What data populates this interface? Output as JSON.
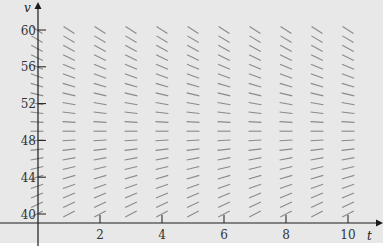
{
  "chart_data": {
    "type": "slope-field",
    "title": "",
    "equation": "dv/dt = 9.8 - v/5",
    "xlabel": "t",
    "ylabel": "v",
    "xlim": [
      0,
      10.5
    ],
    "ylim": [
      39,
      61.5
    ],
    "x_ticks": [
      2,
      4,
      6,
      8,
      10
    ],
    "y_ticks": [
      40,
      44,
      48,
      52,
      56,
      60
    ],
    "grid": false,
    "field_t_values": [
      0,
      1,
      2,
      3,
      4,
      5,
      6,
      7,
      8,
      9,
      10
    ],
    "field_v_values": [
      40,
      41,
      42,
      43,
      44,
      45,
      46,
      47,
      48,
      49,
      50,
      51,
      52,
      53,
      54,
      55,
      56,
      57,
      58,
      59,
      60
    ],
    "equilibrium_v": 49,
    "colors": {
      "background": "#e8e8e8",
      "axis": "#1a1a1a",
      "segment": "#8a8a8a"
    }
  }
}
